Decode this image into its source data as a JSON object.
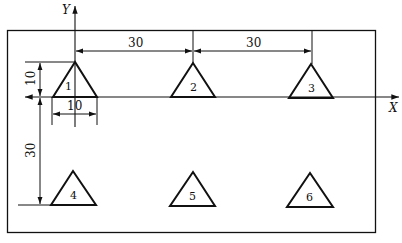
{
  "axes": {
    "x_label": "X",
    "y_label": "Y"
  },
  "dimensions": {
    "top_spacing_1": "30",
    "top_spacing_2": "30",
    "triangle_height": "10",
    "triangle_base": "10",
    "row_spacing": "30"
  },
  "triangles": [
    {
      "label": "1"
    },
    {
      "label": "2"
    },
    {
      "label": "3"
    },
    {
      "label": "4"
    },
    {
      "label": "5"
    },
    {
      "label": "6"
    }
  ],
  "colors": {
    "line": "#111111",
    "background": "#ffffff"
  }
}
